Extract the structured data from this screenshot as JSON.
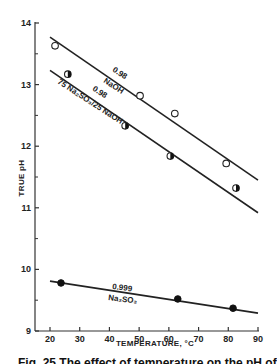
{
  "chart_data": {
    "type": "scatter",
    "title": "",
    "xlabel": "TEMPERATURE, °C",
    "ylabel": "TRUE pH",
    "xlim": [
      20,
      90
    ],
    "ylim": [
      9,
      14
    ],
    "x_ticks": [
      20,
      30,
      40,
      50,
      60,
      70,
      80,
      90
    ],
    "y_ticks": [
      9,
      10,
      11,
      12,
      13,
      14
    ],
    "grid": false,
    "legend": "inline labels on fitted lines",
    "series": [
      {
        "name": "NaOH",
        "correlation_label": "0.98",
        "marker": "open-circle",
        "points": [
          {
            "x": 21.7,
            "y": 13.63
          },
          {
            "x": 50.3,
            "y": 12.82
          },
          {
            "x": 62.0,
            "y": 12.53
          },
          {
            "x": 79.3,
            "y": 11.72
          }
        ],
        "fit_line": {
          "x": [
            20,
            90
          ],
          "y": [
            13.77,
            11.45
          ]
        }
      },
      {
        "name": "75 Na2SO3/25 NaOH",
        "correlation_label": "0.98",
        "marker": "half-filled-circle",
        "points": [
          {
            "x": 26.0,
            "y": 13.17
          },
          {
            "x": 45.3,
            "y": 12.33
          },
          {
            "x": 60.5,
            "y": 11.84
          },
          {
            "x": 82.6,
            "y": 11.32
          }
        ],
        "fit_line": {
          "x": [
            20,
            90
          ],
          "y": [
            13.23,
            10.92
          ]
        }
      },
      {
        "name": "Na2SO3",
        "correlation_label": "0.999",
        "marker": "filled-circle",
        "points": [
          {
            "x": 23.7,
            "y": 9.78
          },
          {
            "x": 63.0,
            "y": 9.52
          },
          {
            "x": 81.6,
            "y": 9.37
          }
        ],
        "fit_line": {
          "x": [
            20,
            90
          ],
          "y": [
            9.81,
            9.29
          ]
        }
      }
    ]
  },
  "labels": {
    "ylabel": "TRUE pH",
    "xlabel": "TEMPERATURE, °C",
    "naoh_r": "0.98",
    "naoh_name": "NaOH",
    "mix_r": "0.98",
    "mix_name": "75 Na₂SO₃/25 NaOH",
    "sulfite_r": "0.999",
    "sulfite_name": "Na₂SO₃",
    "caption": "Fig. 25 The effect of temperature on the pH of"
  }
}
